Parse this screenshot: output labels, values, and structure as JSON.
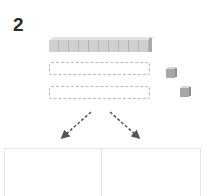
{
  "problem": {
    "number": "2",
    "ten_rod_units": 10,
    "empty_slots": 2,
    "unit_cubes": 2,
    "split_arrows": 2,
    "answer_boxes": 2
  },
  "colors": {
    "rod": "#cfcfcf",
    "cube": "#a6a6a6",
    "slot_border": "#b9b9b9",
    "arrow": "#555555",
    "box_border": "#e4e4e4"
  }
}
